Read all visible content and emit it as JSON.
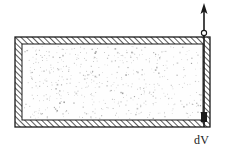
{
  "figure": {
    "background_color": "#ffffff",
    "ink_color": "#1a1a1a",
    "container": {
      "name": "rigid hatched-wall vessel",
      "x": 15,
      "y": 37,
      "width": 195,
      "height": 90,
      "wall_thickness": 7,
      "wall_fill": "hatched",
      "hatch_direction": "forward-slash",
      "hatch_color": "#2a2a2a",
      "hatch_spacing": 4
    },
    "interior": {
      "name": "gas-filled chamber",
      "x": 22,
      "y": 44,
      "width": 181,
      "height": 76,
      "fill": "#fefefe",
      "stipple": "random gas particles",
      "stipple_color": "#9a9a9a",
      "stipple_count": 520
    },
    "rod": {
      "name": "piston rod",
      "x": 204,
      "top_y": 8,
      "bottom_y": 127,
      "stroke_width": 1.6,
      "color": "#1a1a1a"
    },
    "arrow": {
      "name": "upward displacement arrow",
      "direction": "up",
      "tip_x": 204,
      "tip_y": 4,
      "head_width": 7,
      "head_height": 12,
      "color": "#1a1a1a"
    },
    "joint": {
      "name": "rod collar circle",
      "cx": 204,
      "cy": 33,
      "r": 2.6,
      "stroke": "#1a1a1a",
      "fill": "#ffffff"
    },
    "piston_head": {
      "name": "piston head at bottom wall",
      "cx": 204,
      "cy": 120,
      "width": 7,
      "height": 9,
      "fill": "#1a1a1a"
    },
    "labels": {
      "dv": "dV",
      "dv_d": "d",
      "dv_v": "V",
      "ghost_artifact": "     \n     "
    }
  }
}
